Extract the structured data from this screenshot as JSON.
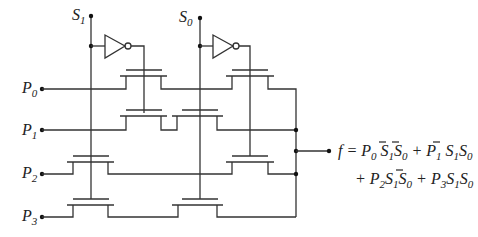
{
  "diagram": {
    "select_inputs": [
      {
        "name": "S",
        "sub": "1"
      },
      {
        "name": "S",
        "sub": "0"
      }
    ],
    "data_inputs": [
      {
        "name": "P",
        "sub": "0"
      },
      {
        "name": "P",
        "sub": "1"
      },
      {
        "name": "P",
        "sub": "2"
      },
      {
        "name": "P",
        "sub": "3"
      }
    ],
    "output": {
      "line1": "f = P0 S1' S0' + P1 S1' S0",
      "line2": "+ P2 S1 S0' + P3 S1 S0"
    },
    "colors": {
      "line": "#333333",
      "text": "#222222",
      "background": "#ffffff"
    }
  }
}
